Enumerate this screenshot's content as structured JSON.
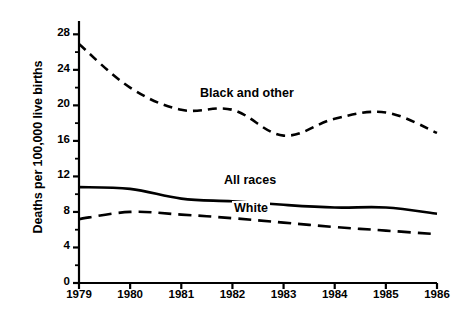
{
  "chart_data": {
    "type": "line",
    "title": "",
    "subtitle": "",
    "xlabel": "",
    "ylabel": "Deaths per 100,000 live births",
    "x": [
      1979,
      1980,
      1981,
      1982,
      1983,
      1984,
      1985,
      1986
    ],
    "categories": [
      "1979",
      "1980",
      "1981",
      "1982",
      "1983",
      "1984",
      "1985",
      "1986"
    ],
    "xlim": [
      1979,
      1986
    ],
    "ylim": [
      0,
      29.5
    ],
    "y_ticks": [
      0,
      4,
      8,
      12,
      16,
      20,
      24,
      28
    ],
    "y_tick_labels": [
      "0",
      "4",
      "8",
      "12",
      "16",
      "20",
      "24",
      "28"
    ],
    "y_minor_ticks": [
      2,
      6,
      10,
      14,
      18,
      22,
      26
    ],
    "grid": false,
    "legend_position": "inline-annotations",
    "series": [
      {
        "name": "Black and other",
        "label": "Black and other",
        "style": "short-dashed",
        "color": "#000000",
        "values": [
          26.9,
          22.0,
          19.5,
          19.5,
          16.6,
          18.5,
          19.2,
          16.9
        ]
      },
      {
        "name": "All races",
        "label": "All races",
        "style": "solid",
        "color": "#000000",
        "values": [
          10.8,
          10.6,
          9.5,
          9.2,
          8.8,
          8.5,
          8.5,
          7.8
        ]
      },
      {
        "name": "White",
        "label": "White",
        "style": "long-dashed",
        "color": "#000000",
        "values": [
          7.2,
          8.0,
          7.7,
          7.3,
          6.8,
          6.3,
          5.9,
          5.5
        ]
      }
    ],
    "annotations": [
      {
        "text": "Black and other",
        "x": 1981.4,
        "y": 21.0
      },
      {
        "text": "All races",
        "x": 1981.9,
        "y": 11.6
      },
      {
        "text": "White",
        "x": 1982.1,
        "y": 9.4
      }
    ]
  },
  "axes": {
    "y_title": "Deaths per 100,000 live births",
    "axis_color": "#000000"
  }
}
